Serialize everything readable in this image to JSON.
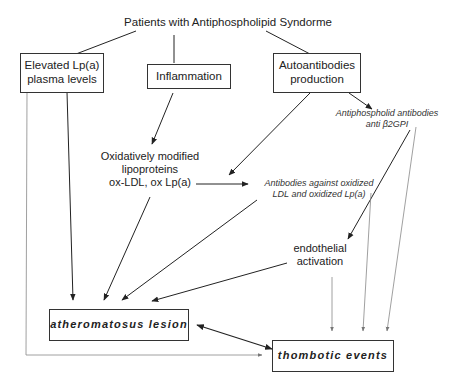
{
  "diagram": {
    "title": "Patients with Antiphospholipid Syndorme",
    "nodes": {
      "lpa": {
        "line1": "Elevated Lp(a)",
        "line2": "plasma levels"
      },
      "inflammation": {
        "label": "Inflammation"
      },
      "autoantibodies": {
        "line1": "Autoantibodies",
        "line2": "production"
      },
      "antiphospholipid": {
        "line1": "Antiphospholid   antibodies",
        "line2": "anti β2GPI"
      },
      "oxidized": {
        "line1": "Oxidatively modified",
        "line2": "lipoproteins",
        "line3": "ox-LDL, ox Lp(a)"
      },
      "antibodies_ox": {
        "line1": "Antibodies against oxidized",
        "line2": "LDL and oxidized Lp(a)"
      },
      "endothelial": {
        "line1": "endothelial",
        "line2": "activation"
      },
      "atheromatous": {
        "label": "atheromatosus  lesion"
      },
      "thrombotic": {
        "label": "thombotic  events"
      }
    },
    "colors": {
      "line": "#222222",
      "grey_line": "#888888",
      "border": "#333333"
    }
  }
}
